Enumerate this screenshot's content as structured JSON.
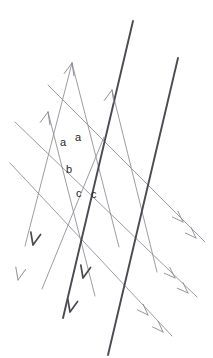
{
  "figure": {
    "kind": "geometry-line-diagram",
    "canvas": {
      "width": 213,
      "height": 358
    },
    "colors": {
      "background": "#ffffff",
      "thick_line": "#4a4a52",
      "thin_line": "#8a8a92",
      "label_text": "#262626"
    },
    "stroke_widths": {
      "thick": 1.9,
      "thin": 0.85
    }
  },
  "labels": [
    {
      "id": "angle-a-left",
      "text": "a",
      "x": 60,
      "y": 137
    },
    {
      "id": "angle-a-right",
      "text": "a",
      "x": 75,
      "y": 132
    },
    {
      "id": "angle-b",
      "text": "b",
      "x": 66,
      "y": 164
    },
    {
      "id": "angle-c-left",
      "text": "c",
      "x": 76,
      "y": 188
    },
    {
      "id": "angle-c-right",
      "text": "c",
      "x": 91,
      "y": 189
    }
  ],
  "thick_transversals": [
    {
      "id": "thick-transversal-left",
      "x1": 133,
      "y1": 21,
      "x2": 63,
      "y2": 318,
      "arrows": 2,
      "direction": "down-left"
    },
    {
      "id": "thick-transversal-right",
      "x1": 178,
      "y1": 58,
      "x2": 108,
      "y2": 355,
      "arrows": 0,
      "direction": "down-left"
    }
  ],
  "parallel_down_lines": [
    {
      "id": "parallel-down-1",
      "x1": 48,
      "y1": 85,
      "x2": 205,
      "y2": 242,
      "arrows": 2
    },
    {
      "id": "parallel-down-2",
      "x1": 15,
      "y1": 122,
      "x2": 197,
      "y2": 297,
      "arrows": 2
    },
    {
      "id": "parallel-down-3",
      "x1": 10,
      "y1": 163,
      "x2": 172,
      "y2": 336,
      "arrows": 2
    },
    {
      "id": "parallel-down-4",
      "x1": 104,
      "y1": 137,
      "x2": 42,
      "y2": 289,
      "arrows": 2
    }
  ],
  "ascending_lines": [
    {
      "id": "ascending-1",
      "x1": 25,
      "y1": 246,
      "x2": 72,
      "y2": 63,
      "arrows": 1,
      "direction": "up-right"
    },
    {
      "id": "ascending-2",
      "x1": 48,
      "y1": 112,
      "x2": 95,
      "y2": 296,
      "arrows": 1,
      "direction": "up-left-origin"
    },
    {
      "id": "ascending-3",
      "x1": 112,
      "y1": 90,
      "x2": 157,
      "y2": 272,
      "arrows": 1,
      "direction": "up-left-origin"
    },
    {
      "id": "ascending-4",
      "x1": 72,
      "y1": 63,
      "x2": 119,
      "y2": 247,
      "arrows": 1,
      "direction": "up-left-origin"
    }
  ],
  "arrowheads_down_right": [
    {
      "id": "arrowhead-dr-1a",
      "x": 183,
      "y": 222
    },
    {
      "id": "arrowhead-dr-1b",
      "x": 196,
      "y": 238
    },
    {
      "id": "arrowhead-dr-2a",
      "x": 175,
      "y": 278
    },
    {
      "id": "arrowhead-dr-2b",
      "x": 188,
      "y": 293
    },
    {
      "id": "arrowhead-dr-3a",
      "x": 148,
      "y": 315
    },
    {
      "id": "arrowhead-dr-3b",
      "x": 163,
      "y": 332
    }
  ],
  "arrowheads_down_left": [
    {
      "id": "arrowhead-dl-1a",
      "x": 33,
      "y": 245
    },
    {
      "id": "arrowhead-dl-1b",
      "x": 18,
      "y": 280
    },
    {
      "id": "arrowhead-dl-2a",
      "x": 83,
      "y": 278
    },
    {
      "id": "arrowhead-dl-2b",
      "x": 70,
      "y": 312
    }
  ],
  "arrowheads_up": [
    {
      "id": "arrowhead-up-1",
      "x": 48,
      "y": 112
    },
    {
      "id": "arrowhead-up-2",
      "x": 72,
      "y": 63
    },
    {
      "id": "arrowhead-up-3",
      "x": 112,
      "y": 90
    }
  ],
  "intersection_nodes": [
    {
      "id": "node-top",
      "x": 86,
      "y": 118
    },
    {
      "id": "node-middle",
      "x": 64,
      "y": 170
    },
    {
      "id": "node-right",
      "x": 133,
      "y": 170
    },
    {
      "id": "node-lower",
      "x": 112,
      "y": 215
    }
  ]
}
